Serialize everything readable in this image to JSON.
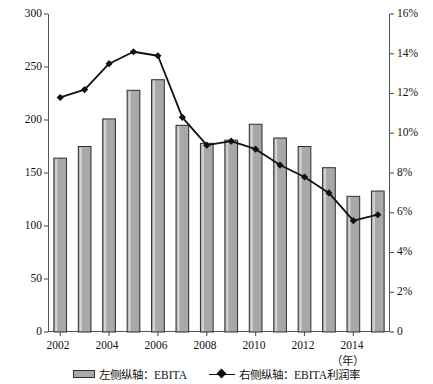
{
  "chart_data": {
    "type": "bar",
    "title": "",
    "subtitle": "",
    "xlabel": "（年）",
    "ylabel": "（百万英镑）",
    "categories": [
      2002,
      2003,
      2004,
      2005,
      2006,
      2007,
      2008,
      2009,
      2010,
      2011,
      2012,
      2013,
      2014,
      2015
    ],
    "x_tick_labels": [
      "2002",
      "2004",
      "2006",
      "2008",
      "2010",
      "2012",
      "2014"
    ],
    "x_tick_values": [
      2002,
      2004,
      2006,
      2008,
      2010,
      2012,
      2014
    ],
    "grid": false,
    "legend_position": "bottom",
    "series": [
      {
        "name": "左侧纵轴：EBITA",
        "type": "bar",
        "axis": "left",
        "unit": "百万英镑",
        "color": "#a8a8a8",
        "edge_color": "#2e2e2e",
        "values": [
          164,
          175,
          201,
          228,
          238,
          195,
          178,
          181,
          196,
          183,
          175,
          155,
          128,
          133
        ]
      },
      {
        "name": "右侧纵轴：EBITA利润率",
        "type": "line",
        "axis": "right",
        "unit": "%",
        "color": "#111111",
        "marker": "diamond",
        "values": [
          11.8,
          12.2,
          13.5,
          14.1,
          13.9,
          10.8,
          9.4,
          9.6,
          9.2,
          8.4,
          7.8,
          7.0,
          5.6,
          5.9
        ]
      }
    ],
    "left_axis": {
      "label": "（百万英镑）",
      "ylim": [
        0,
        300
      ],
      "ticks": [
        0,
        50,
        100,
        150,
        200,
        250,
        300
      ],
      "tick_labels": [
        "0",
        "50",
        "100",
        "150",
        "200",
        "250",
        "300"
      ]
    },
    "right_axis": {
      "label": "",
      "ylim": [
        0,
        16
      ],
      "ticks": [
        0,
        2,
        4,
        6,
        8,
        10,
        12,
        14,
        16
      ],
      "tick_labels": [
        "0",
        "2%",
        "4%",
        "6%",
        "8%",
        "10%",
        "12%",
        "14%",
        "16%"
      ]
    }
  },
  "legend": {
    "items": [
      {
        "label": "左侧纵轴：EBITA",
        "marker": "bar-swatch"
      },
      {
        "label": "右侧纵轴：EBITA利润率",
        "marker": "line-diamond-swatch"
      }
    ]
  }
}
